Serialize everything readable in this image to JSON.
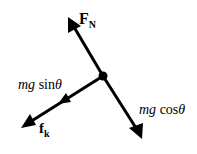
{
  "diagram": {
    "type": "free-body-diagram",
    "forces": [
      {
        "id": "normal",
        "symbol": "F",
        "subscript": "N",
        "direction": "up-left"
      },
      {
        "id": "gravity_parallel",
        "prefix": "mg",
        "func": "sin",
        "angle": "θ",
        "direction": "down-left"
      },
      {
        "id": "kinetic_friction",
        "symbol": "f",
        "subscript": "k",
        "direction": "down-left"
      },
      {
        "id": "gravity_perpendicular",
        "prefix": "mg",
        "func": "cos",
        "angle": "θ",
        "direction": "down-right"
      }
    ],
    "colors": {
      "arrow": "#000000",
      "background": "#ffffff"
    }
  }
}
